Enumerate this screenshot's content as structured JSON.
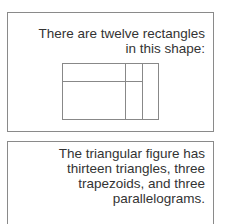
{
  "card1": {
    "lines": [
      "There are twelve rectangles",
      "in this shape:"
    ],
    "figure": "rectangle-subdivision-diagram"
  },
  "card2": {
    "lines": [
      "The triangular figure has",
      "thirteen triangles, three",
      "trapezoids, and three",
      "parallelograms."
    ]
  },
  "colors": {
    "border": "#8a8a8a",
    "text": "#333333",
    "shape_stroke": "#888888"
  }
}
